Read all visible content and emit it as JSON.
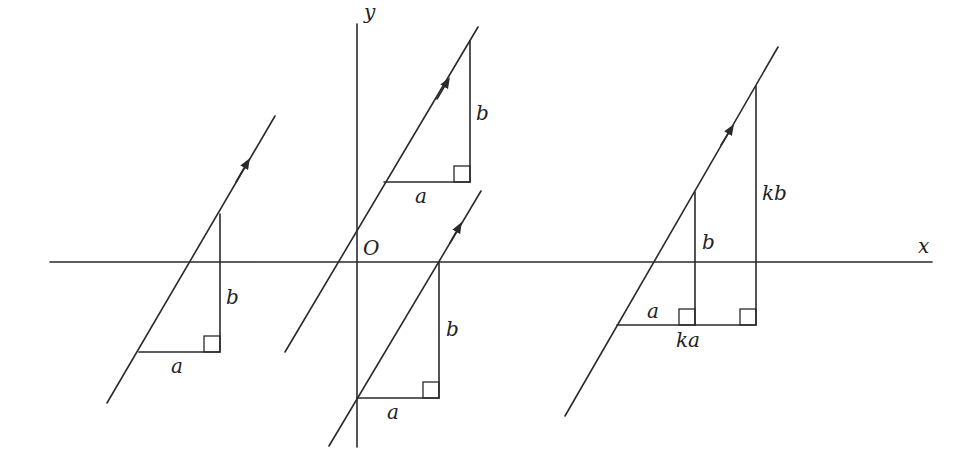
{
  "figure": {
    "axes": {
      "x_label": "x",
      "y_label": "y",
      "origin_label": "O"
    },
    "left_vector": {
      "run_label": "a",
      "rise_label": "b"
    },
    "upper_vector": {
      "run_label": "a",
      "rise_label": "b"
    },
    "lower_vector": {
      "run_label": "a",
      "rise_label": "b"
    },
    "right_vector": {
      "run_label": "a",
      "rise_label": "b",
      "scaled_run_label": "ka",
      "scaled_rise_label": "kb"
    }
  },
  "colors": {
    "stroke": "#2a2a2a",
    "background": "#ffffff"
  }
}
